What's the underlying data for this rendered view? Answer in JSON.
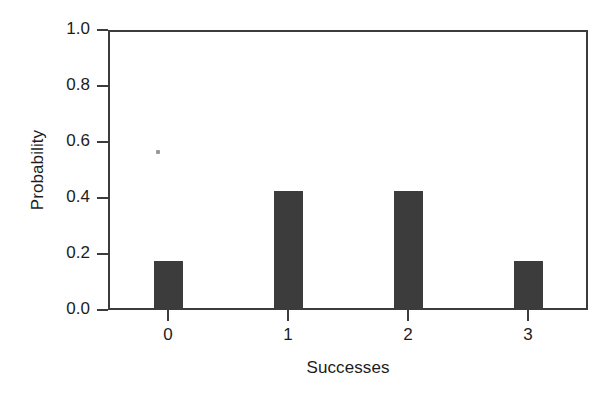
{
  "chart_data": {
    "type": "bar",
    "title": "",
    "subtitle": "",
    "xlabel": "Successes",
    "ylabel": "Probability",
    "categories": [
      "0",
      "1",
      "2",
      "3"
    ],
    "values": [
      0.175,
      0.425,
      0.425,
      0.175
    ],
    "series": [
      {
        "name": "Probability",
        "values": [
          0.175,
          0.425,
          0.425,
          0.175
        ]
      }
    ],
    "xlim": [
      -0.5,
      3.5
    ],
    "ylim": [
      0.0,
      1.0
    ],
    "ytick_labels": [
      "0.0",
      "0.2",
      "0.4",
      "0.6",
      "0.8",
      "1.0"
    ],
    "ytick_values": [
      0.0,
      0.2,
      0.4,
      0.6,
      0.8,
      1.0
    ],
    "xtick_labels": [
      "0",
      "1",
      "2",
      "3"
    ],
    "xtick_values": [
      0,
      1,
      2,
      3
    ],
    "grid": false,
    "legend": false,
    "legend_position": "none",
    "bar_color": "#3c3c3c",
    "axis_color": "#3c3c3c",
    "background_color": "#ffffff",
    "annotations": []
  },
  "figure": {
    "artifact_name": "scan-speck"
  }
}
